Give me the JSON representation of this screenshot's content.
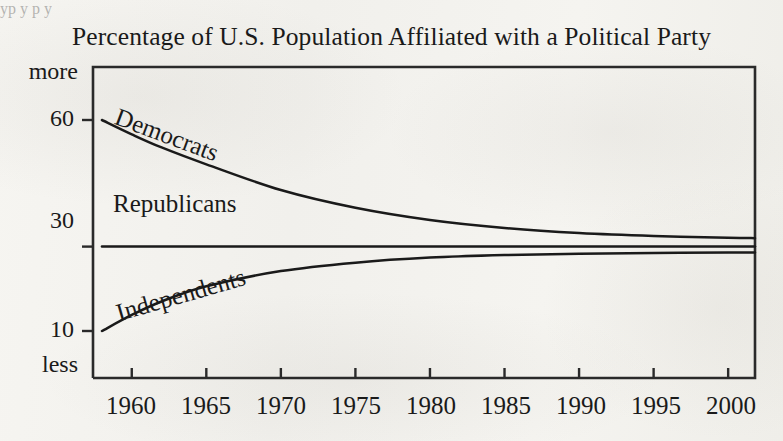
{
  "chart_data": {
    "type": "line",
    "title": "Percentage of U.S. Population Affiliated with a Political Party",
    "xlabel": "",
    "ylabel": "",
    "xlim": [
      1957.4,
      2001.8
    ],
    "ylim": [
      3,
      70
    ],
    "grid": false,
    "legend_position": "inline-on-curve",
    "y_tick_values": [
      60,
      30,
      10
    ],
    "y_tick_labels": [
      "60",
      "30",
      "10"
    ],
    "y_axis_end_labels": {
      "top": "more",
      "bottom": "less"
    },
    "x_tick_labels": [
      "1960",
      "1965",
      "1970",
      "1975",
      "1980",
      "1985",
      "1990",
      "1995",
      "2000"
    ],
    "x_tick_values": [
      1960,
      1965,
      1970,
      1975,
      1980,
      1985,
      1990,
      1995,
      2000
    ],
    "x": [
      1958,
      1960,
      1962,
      1965,
      1970,
      1975,
      1980,
      1985,
      1990,
      1995,
      2000,
      2001.8
    ],
    "series": [
      {
        "name": "Democrats",
        "label": "Democrats",
        "color": "#1a1a1a",
        "values": [
          60,
          56.6,
          53.5,
          49.5,
          43.4,
          39.2,
          36.3,
          34.4,
          33.2,
          32.5,
          32.1,
          32.0
        ]
      },
      {
        "name": "Republicans",
        "label": "Republicans",
        "color": "#1a1a1a",
        "values": [
          30,
          30,
          30,
          30,
          30,
          30,
          30,
          30,
          30,
          30,
          30,
          30
        ]
      },
      {
        "name": "Independents",
        "label": "Independents",
        "color": "#1a1a1a",
        "values": [
          10,
          13.8,
          17.0,
          20.6,
          24.2,
          26.2,
          27.4,
          28.0,
          28.3,
          28.5,
          28.6,
          28.6
        ]
      }
    ]
  },
  "annotations": {
    "bleed_through_top": "yp  y p       y",
    "ghost_text_right": "   "
  },
  "colors": {
    "ink": "#1a1a1a",
    "paper": "#f3f2ee",
    "frame": "#2a2a2a"
  }
}
